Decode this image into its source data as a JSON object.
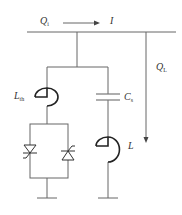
{
  "diagram": {
    "type": "circuit",
    "title": "",
    "labels": {
      "q_i": {
        "main": "Q",
        "sub": "i"
      },
      "current": {
        "main": "I",
        "sub": ""
      },
      "q_l": {
        "main": "Q",
        "sub": "L"
      },
      "l_th": {
        "main": "L",
        "sub": "th"
      },
      "c_s": {
        "main": "C",
        "sub": "s"
      },
      "l": {
        "main": "L",
        "sub": ""
      }
    },
    "components": [
      {
        "id": "bus",
        "type": "busbar"
      },
      {
        "id": "current-arrow",
        "type": "arrow",
        "label": "I"
      },
      {
        "id": "load-arrow",
        "type": "arrow",
        "label": "QL"
      },
      {
        "id": "l-th",
        "type": "inductor",
        "label": "Lth"
      },
      {
        "id": "thyristor-pair",
        "type": "antiparallel-thyristors"
      },
      {
        "id": "c-s",
        "type": "capacitor",
        "label": "Cs"
      },
      {
        "id": "l",
        "type": "inductor",
        "label": "L"
      },
      {
        "id": "ground-left",
        "type": "ground"
      },
      {
        "id": "ground-right",
        "type": "ground"
      }
    ],
    "colors": {
      "line": "#555555",
      "coil": "#222222",
      "text": "#333333"
    }
  }
}
